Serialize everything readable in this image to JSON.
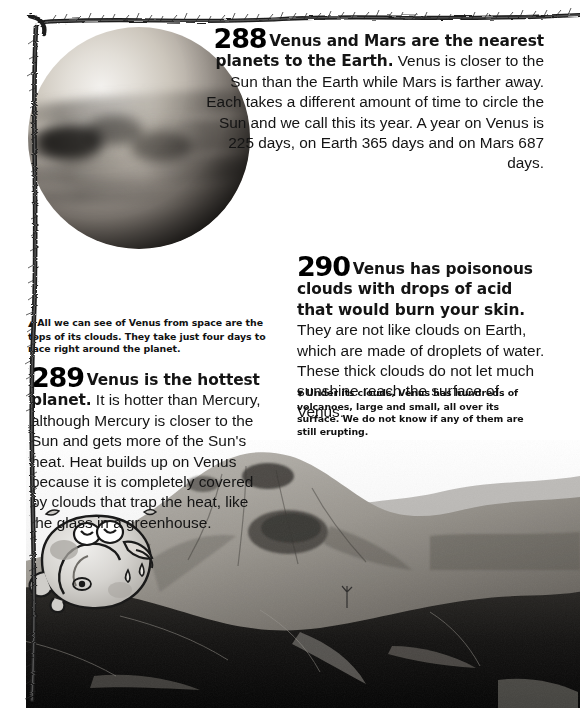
{
  "page": {
    "width": 580,
    "height": 708,
    "background_color": "#ffffff",
    "ink_color": "#111111"
  },
  "facts": [
    {
      "number": "288",
      "lead": "Venus and Mars are the nearest planets to the Earth.",
      "body": " Venus is closer to the Sun than the Earth while Mars is farther away. Each takes a different amount of time to circle the Sun and we call this its year. A year on Venus is 225 days, on Earth 365 days and on Mars 687 days.",
      "align": "right"
    },
    {
      "number": "289",
      "lead": "Venus is the hottest planet.",
      "body": " It is hotter than Mercury, although Mercury is closer to the Sun and gets more of the Sun's heat. Heat builds up on Venus because it is completely covered by clouds that trap the heat, like the glass in a greenhouse.",
      "align": "left"
    },
    {
      "number": "290",
      "lead": "Venus has poisonous clouds with drops of acid that would burn your skin.",
      "body": " They are not like clouds on Earth, which are made of droplets of water. These thick clouds do not let much sunshine reach the surface of Venus.",
      "align": "left"
    }
  ],
  "captions": [
    {
      "marker": "▲",
      "marker_name": "up-triangle",
      "text": "All we can see of Venus from space are the tops of its clouds. They take just four days to race right around the planet."
    },
    {
      "marker": "▼",
      "marker_name": "down-triangle",
      "text": "Under its clouds, Venus has hundreds of volcanoes, large and small, all over its surface. We do not know if any of them are still erupting."
    }
  ],
  "images": {
    "venus_sphere": {
      "name": "venus-planet-photo",
      "alt": "Greyscale photograph of Venus showing banded cloud tops"
    },
    "volcano_landscape": {
      "name": "volcano-landscape-photo",
      "alt": "Dark greyscale volcanic mountain landscape"
    },
    "cartoon": {
      "name": "melting-planet-cartoon",
      "alt": "Cartoon of a sweating, melting planet with eyes and tongue out"
    },
    "border": {
      "name": "twig-rope-border",
      "alt": "Hand-drawn rough twig border along top and left edges"
    }
  }
}
